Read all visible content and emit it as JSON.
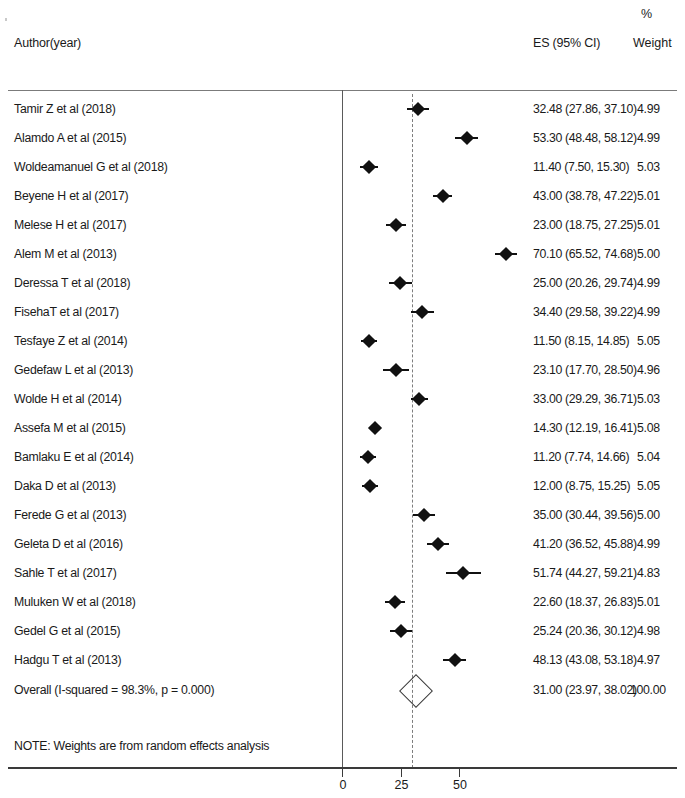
{
  "header": {
    "author_label": "Author(year)",
    "es_label": "ES (95% CI)",
    "percent_label": "%",
    "weight_label": "Weight"
  },
  "note": "NOTE: Weights are from random effects analysis",
  "overall": {
    "label": "Overall  (I-squared = 98.3%, p = 0.000)",
    "es_text": "31.00 (23.97, 38.02)",
    "weight_text": "100.00"
  },
  "axis": {
    "ticks": [
      "0",
      "25",
      "50"
    ]
  },
  "chart_data": {
    "type": "forest",
    "title": "",
    "xlabel": "",
    "ylabel": "",
    "xlim": [
      -2,
      78
    ],
    "x_ticks": [
      0,
      25,
      50
    ],
    "grid": false,
    "reference_line": 0,
    "summary_line": 31.0,
    "heterogeneity": {
      "i_squared": "98.3%",
      "p_value": "0.000"
    },
    "columns": [
      "Author(year)",
      "ES (95% CI)",
      "% Weight"
    ],
    "studies": [
      {
        "label": "Tamir Z et al (2018)",
        "es": 32.48,
        "lcl": 27.86,
        "ucl": 37.1,
        "weight": 4.99,
        "es_text": "32.48 (27.86, 37.10)",
        "weight_text": "4.99"
      },
      {
        "label": "Alamdo A et al (2015)",
        "es": 53.3,
        "lcl": 48.48,
        "ucl": 58.12,
        "weight": 4.99,
        "es_text": "53.30 (48.48, 58.12)",
        "weight_text": "4.99"
      },
      {
        "label": "Woldeamanuel G et al (2018)",
        "es": 11.4,
        "lcl": 7.5,
        "ucl": 15.3,
        "weight": 5.03,
        "es_text": "11.40 (7.50, 15.30)",
        "weight_text": "5.03"
      },
      {
        "label": "Beyene H et al (2017)",
        "es": 43.0,
        "lcl": 38.78,
        "ucl": 47.22,
        "weight": 5.01,
        "es_text": "43.00 (38.78, 47.22)",
        "weight_text": "5.01"
      },
      {
        "label": "Melese H et al (2017)",
        "es": 23.0,
        "lcl": 18.75,
        "ucl": 27.25,
        "weight": 5.01,
        "es_text": "23.00 (18.75, 27.25)",
        "weight_text": "5.01"
      },
      {
        "label": "Alem M et al (2013)",
        "es": 70.1,
        "lcl": 65.52,
        "ucl": 74.68,
        "weight": 5.0,
        "es_text": "70.10 (65.52, 74.68)",
        "weight_text": "5.00"
      },
      {
        "label": "Deressa T et al (2018)",
        "es": 25.0,
        "lcl": 20.26,
        "ucl": 29.74,
        "weight": 4.99,
        "es_text": "25.00 (20.26, 29.74)",
        "weight_text": "4.99"
      },
      {
        "label": "FisehaT et al (2017)",
        "es": 34.4,
        "lcl": 29.58,
        "ucl": 39.22,
        "weight": 4.99,
        "es_text": "34.40 (29.58, 39.22)",
        "weight_text": "4.99"
      },
      {
        "label": "Tesfaye Z et al (2014)",
        "es": 11.5,
        "lcl": 8.15,
        "ucl": 14.85,
        "weight": 5.05,
        "es_text": "11.50 (8.15, 14.85)",
        "weight_text": "5.05"
      },
      {
        "label": "Gedefaw L et al (2013)",
        "es": 23.1,
        "lcl": 17.7,
        "ucl": 28.5,
        "weight": 4.96,
        "es_text": "23.10 (17.70, 28.50)",
        "weight_text": "4.96"
      },
      {
        "label": "Wolde H et al (2014)",
        "es": 33.0,
        "lcl": 29.29,
        "ucl": 36.71,
        "weight": 5.03,
        "es_text": "33.00 (29.29, 36.71)",
        "weight_text": "5.03"
      },
      {
        "label": "Assefa M et al (2015)",
        "es": 14.3,
        "lcl": 12.19,
        "ucl": 16.41,
        "weight": 5.08,
        "es_text": "14.30 (12.19, 16.41)",
        "weight_text": "5.08"
      },
      {
        "label": "Bamlaku E et al (2014)",
        "es": 11.2,
        "lcl": 7.74,
        "ucl": 14.66,
        "weight": 5.04,
        "es_text": "11.20 (7.74, 14.66)",
        "weight_text": "5.04"
      },
      {
        "label": "Daka D et al (2013)",
        "es": 12.0,
        "lcl": 8.75,
        "ucl": 15.25,
        "weight": 5.05,
        "es_text": "12.00 (8.75, 15.25)",
        "weight_text": "5.05"
      },
      {
        "label": "Ferede G et al (2013)",
        "es": 35.0,
        "lcl": 30.44,
        "ucl": 39.56,
        "weight": 5.0,
        "es_text": "35.00 (30.44, 39.56)",
        "weight_text": "5.00"
      },
      {
        "label": "Geleta D et al (2016)",
        "es": 41.2,
        "lcl": 36.52,
        "ucl": 45.88,
        "weight": 4.99,
        "es_text": "41.20 (36.52, 45.88)",
        "weight_text": "4.99"
      },
      {
        "label": "Sahle T et al (2017)",
        "es": 51.74,
        "lcl": 44.27,
        "ucl": 59.21,
        "weight": 4.83,
        "es_text": "51.74 (44.27, 59.21)",
        "weight_text": "4.83"
      },
      {
        "label": "Muluken W et al (2018)",
        "es": 22.6,
        "lcl": 18.37,
        "ucl": 26.83,
        "weight": 5.01,
        "es_text": "22.60 (18.37, 26.83)",
        "weight_text": "5.01"
      },
      {
        "label": "Gedel G et al (2015)",
        "es": 25.24,
        "lcl": 20.36,
        "ucl": 30.12,
        "weight": 4.98,
        "es_text": "25.24 (20.36, 30.12)",
        "weight_text": "4.98"
      },
      {
        "label": "Hadgu T et al (2013)",
        "es": 48.13,
        "lcl": 43.08,
        "ucl": 53.18,
        "weight": 4.97,
        "es_text": "48.13 (43.08, 53.18)",
        "weight_text": "4.97"
      }
    ],
    "overall": {
      "label": "Overall  (I-squared = 98.3%, p = 0.000)",
      "es": 31.0,
      "lcl": 23.97,
      "ucl": 38.02,
      "weight": 100.0
    }
  }
}
